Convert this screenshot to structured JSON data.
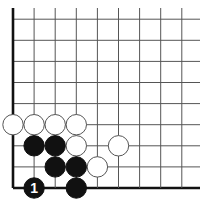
{
  "board": {
    "background": "#ffffff",
    "line_color": "#555555",
    "edge_color": "#111111",
    "cols": 9,
    "rows": 9,
    "origin_x": 13,
    "origin_y": 188,
    "spacing": 21.1,
    "top_y": 8,
    "right_x": 200,
    "stone_radius": 10.2
  },
  "stones": [
    {
      "color": "white",
      "col": 0,
      "row": 3
    },
    {
      "color": "white",
      "col": 1,
      "row": 3
    },
    {
      "color": "white",
      "col": 2,
      "row": 3
    },
    {
      "color": "white",
      "col": 3,
      "row": 3
    },
    {
      "color": "black",
      "col": 1,
      "row": 2
    },
    {
      "color": "black",
      "col": 2,
      "row": 2
    },
    {
      "color": "white",
      "col": 3,
      "row": 2
    },
    {
      "color": "white",
      "col": 5,
      "row": 2
    },
    {
      "color": "black",
      "col": 2,
      "row": 1
    },
    {
      "color": "black",
      "col": 3,
      "row": 1
    },
    {
      "color": "white",
      "col": 4,
      "row": 1
    },
    {
      "color": "black",
      "col": 1,
      "row": 0,
      "label": "1"
    },
    {
      "color": "black",
      "col": 3,
      "row": 0
    }
  ]
}
